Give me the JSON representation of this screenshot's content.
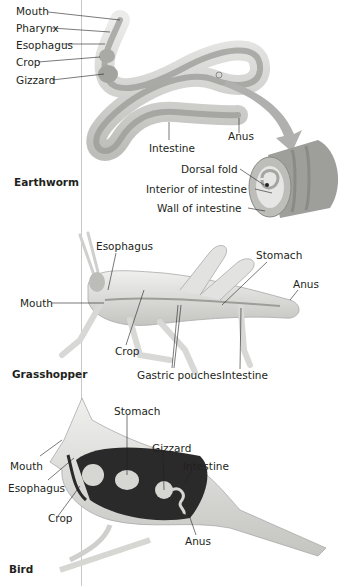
{
  "sections": {
    "earthworm": {
      "title": "Earthworm",
      "labels": [
        "Mouth",
        "Pharynx",
        "Esophagus",
        "Crop",
        "Gizzard",
        "Intestine",
        "Anus"
      ],
      "inset_labels": [
        "Dorsal fold",
        "Interior of intestine",
        "Wall of intestine"
      ]
    },
    "grasshopper": {
      "title": "Grasshopper",
      "labels": [
        "Esophagus",
        "Mouth",
        "Crop",
        "Stomach",
        "Anus",
        "Gastric pouches",
        "Intestine"
      ]
    },
    "bird": {
      "title": "Bird",
      "labels": [
        "Stomach",
        "Gizzard",
        "Intestine",
        "Mouth",
        "Esophagus",
        "Crop",
        "Anus"
      ]
    }
  },
  "colors": {
    "label_text": "#231f20",
    "leader_line": "#231f20",
    "divider": "#c8c8c8",
    "body_light": "#e4e4e2",
    "body_mid": "#b9b9b6",
    "gut_dark": "#2a2a2a",
    "arrow": "#b0b0ae"
  }
}
